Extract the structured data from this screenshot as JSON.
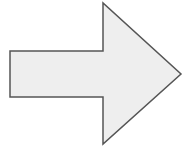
{
  "diagram": {
    "shape": "right-arrow",
    "fill": "#eeeeee",
    "stroke": "#555555",
    "stroke_width": 1.5,
    "points": "10,51 103,51 103,3 181,74 103,144 103,97 10,97"
  }
}
